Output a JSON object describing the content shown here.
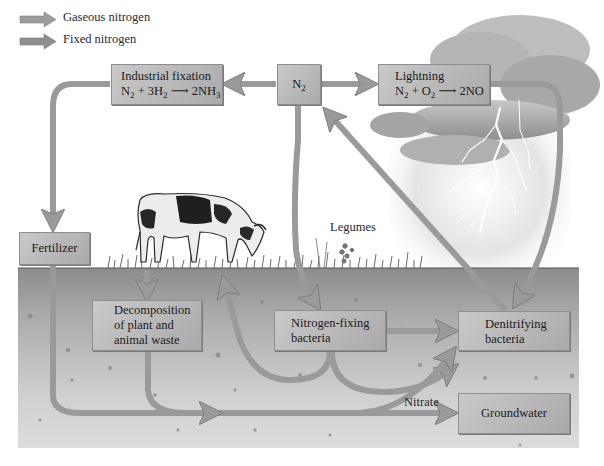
{
  "legend": {
    "items": [
      {
        "label": "Gaseous nitrogen",
        "icon": "arrow-right-icon",
        "color": "#9a9a9a"
      },
      {
        "label": "Fixed nitrogen",
        "icon": "arrow-right-icon",
        "color": "#8c8c8c"
      }
    ]
  },
  "boxes": {
    "industrial_fixation": {
      "title": "Industrial fixation",
      "equation": {
        "lhs1": "N",
        "lhs1_sub": "2",
        "plus": " + 3H",
        "lhs2_sub": "2",
        "arrow": " ⟶ ",
        "rhs": "2NH",
        "rhs_sub": "3"
      }
    },
    "n2": {
      "label": "N",
      "label_sub": "2"
    },
    "lightning": {
      "title": "Lightning",
      "equation": {
        "lhs1": "N",
        "lhs1_sub": "2",
        "plus": " + O",
        "lhs2_sub": "2",
        "arrow": " ⟶ ",
        "rhs": "2NO"
      }
    },
    "fertilizer": {
      "label": "Fertilizer"
    },
    "decomposition": {
      "line1": "Decomposition",
      "line2": "of plant and",
      "line3": "animal waste"
    },
    "nitrogen_fixing": {
      "line1": "Nitrogen-fixing",
      "line2": "bacteria"
    },
    "denitrifying": {
      "line1": "Denitrifying",
      "line2": "bacteria"
    },
    "groundwater": {
      "label": "Groundwater"
    }
  },
  "labels": {
    "legumes": "Legumes",
    "nitrate": "Nitrate"
  },
  "colors": {
    "arrow": "#9a9a9a",
    "arrow_edge": "#7c7c7c",
    "box": "#bdbdbd",
    "soil_top": "#8f8f8f",
    "soil_bottom": "#d8d8d8",
    "cloud": "#a8a8a8"
  }
}
